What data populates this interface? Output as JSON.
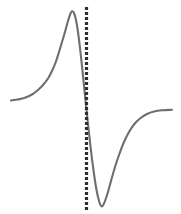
{
  "figure": {
    "name": "derivative-lineshape-plot",
    "width": 214,
    "background_color": "#ffffff"
  },
  "chart_data": {
    "type": "line",
    "title": "",
    "subtitle": "",
    "xlabel": "",
    "ylabel": "",
    "xlim": [
      0,
      181
    ],
    "ylim": [
      214,
      0
    ],
    "grid": false,
    "legend": null,
    "axes_visible": false,
    "tick_labels": {
      "x": [],
      "y": []
    },
    "series": [
      {
        "name": "derivative-curve",
        "color": "#6e6e6e",
        "line_width": 2.1,
        "style": "solid",
        "points": [
          [
            11,
            100.5
          ],
          [
            18,
            99.5
          ],
          [
            25,
            97.8
          ],
          [
            32,
            94.5
          ],
          [
            38,
            90.0
          ],
          [
            43,
            85.0
          ],
          [
            48,
            78.5
          ],
          [
            52,
            71.0
          ],
          [
            56,
            61.5
          ],
          [
            59,
            52.0
          ],
          [
            62,
            42.0
          ],
          [
            65,
            32.0
          ],
          [
            68,
            21.0
          ],
          [
            70.5,
            13.5
          ],
          [
            72,
            11.2
          ],
          [
            74,
            13.0
          ],
          [
            76,
            20.0
          ],
          [
            78,
            32.0
          ],
          [
            80,
            48.0
          ],
          [
            82,
            66.0
          ],
          [
            84,
            86.0
          ],
          [
            86,
            105.0
          ],
          [
            88,
            124.0
          ],
          [
            90,
            142.0
          ],
          [
            92,
            159.0
          ],
          [
            94,
            174.0
          ],
          [
            96,
            187.0
          ],
          [
            98,
            197.0
          ],
          [
            100,
            204.0
          ],
          [
            101.5,
            206.3
          ],
          [
            103,
            205.5
          ],
          [
            105,
            201.0
          ],
          [
            108,
            192.0
          ],
          [
            111,
            181.0
          ],
          [
            115,
            167.0
          ],
          [
            119,
            155.0
          ],
          [
            124,
            142.0
          ],
          [
            129,
            132.0
          ],
          [
            134,
            124.5
          ],
          [
            140,
            118.5
          ],
          [
            147,
            114.0
          ],
          [
            154,
            111.5
          ],
          [
            162,
            110.3
          ],
          [
            172,
            109.8
          ]
        ]
      }
    ],
    "annotations": [
      {
        "name": "zero-crossing-marker",
        "type": "vertical-dotted-line",
        "x": 86.5,
        "y_start": 7,
        "y_end": 211,
        "color": "#2f2f2f",
        "line_width": 3.2,
        "dash_pattern": "3,2"
      }
    ]
  }
}
